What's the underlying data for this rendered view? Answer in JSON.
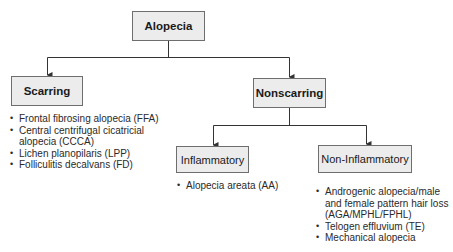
{
  "diagram": {
    "type": "flowchart-tree",
    "root": {
      "label": "Alopecia"
    },
    "level1": [
      {
        "label": "Scarring",
        "items": [
          "Frontal fibrosing alopecia (FFA)",
          "Central centrifugal cicatricial alopecia (CCCA)",
          "Lichen planopilaris (LPP)",
          "Folliculitis decalvans (FD)"
        ]
      },
      {
        "label": "Nonscarring",
        "children": [
          {
            "label": "Inflammatory",
            "items": [
              "Alopecia areata (AA)"
            ]
          },
          {
            "label": "Non-Inflammatory",
            "items": [
              "Androgenic alopecia/male and female pattern hair loss (AGA/MPHL/FPHL)",
              "Telogen effluvium (TE)",
              "Mechanical alopecia"
            ]
          }
        ]
      }
    ]
  },
  "colors": {
    "box_fill": "#ececec",
    "box_border": "#6e6e6e",
    "line": "#333333"
  }
}
